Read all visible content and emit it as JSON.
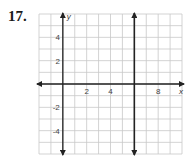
{
  "problem_number": "17.",
  "chart_data": {
    "type": "line",
    "title": "",
    "xlabel": "x",
    "ylabel": "y",
    "xlim": [
      -2,
      10
    ],
    "ylim": [
      -6,
      6
    ],
    "grid": true,
    "x_ticks": [
      2,
      4,
      8
    ],
    "y_ticks": [
      4,
      2,
      -2,
      -4
    ],
    "series": [
      {
        "name": "vertical line x = 6",
        "x": [
          6,
          6
        ],
        "y": [
          -6,
          6
        ]
      }
    ]
  }
}
